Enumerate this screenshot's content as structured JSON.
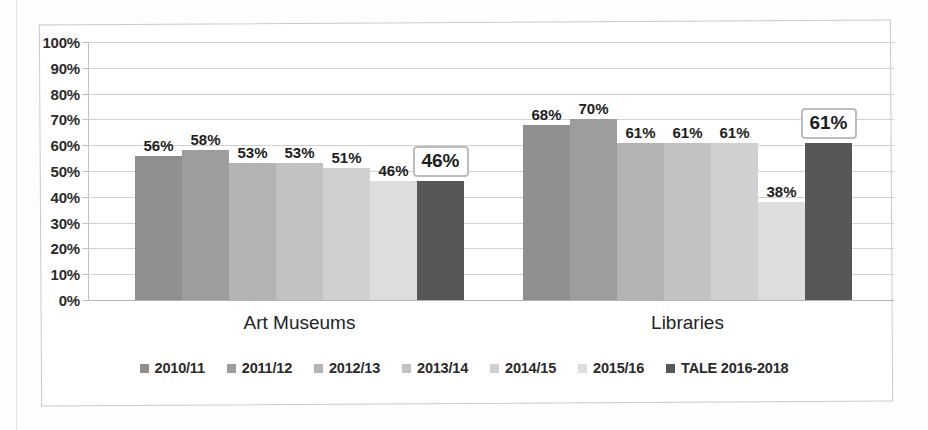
{
  "chart_data": {
    "type": "bar",
    "title": "",
    "subtitle": "",
    "xlabel": "",
    "ylabel": "",
    "ylim": [
      0,
      100
    ],
    "ytick_labels": [
      "100%",
      "90%",
      "80%",
      "70%",
      "60%",
      "50%",
      "40%",
      "30%",
      "20%",
      "10%",
      "0%"
    ],
    "ytick_values": [
      100,
      90,
      80,
      70,
      60,
      50,
      40,
      30,
      20,
      10,
      0
    ],
    "grid": true,
    "legend_position": "bottom",
    "categories": [
      "Art Museums",
      "Libraries"
    ],
    "series": [
      {
        "name": "2010/11",
        "color": "#8f8f8f",
        "values": [
          56,
          68
        ],
        "labels": [
          "56%",
          "68%"
        ]
      },
      {
        "name": "2011/12",
        "color": "#9d9d9d",
        "values": [
          58,
          70
        ],
        "labels": [
          "58%",
          "70%"
        ]
      },
      {
        "name": "2012/13",
        "color": "#b3b3b3",
        "values": [
          53,
          61
        ],
        "labels": [
          "53%",
          "61%"
        ]
      },
      {
        "name": "2013/14",
        "color": "#c2c2c2",
        "values": [
          53,
          61
        ],
        "labels": [
          "53%",
          "61%"
        ]
      },
      {
        "name": "2014/15",
        "color": "#d0d0d0",
        "values": [
          51,
          61
        ],
        "labels": [
          "51%",
          "61%"
        ]
      },
      {
        "name": "2015/16",
        "color": "#dddddd",
        "values": [
          46,
          38
        ],
        "labels": [
          "46%",
          "38%"
        ]
      },
      {
        "name": "TALE 2016-2018",
        "color": "#575757",
        "values": [
          46,
          61
        ],
        "labels": [
          "46%",
          "61%"
        ],
        "highlighted": true
      }
    ]
  },
  "legend": {
    "items": [
      {
        "label": "2010/11",
        "color": "#8f8f8f"
      },
      {
        "label": "2011/12",
        "color": "#9d9d9d"
      },
      {
        "label": "2012/13",
        "color": "#b3b3b3"
      },
      {
        "label": "2013/14",
        "color": "#c2c2c2"
      },
      {
        "label": "2014/15",
        "color": "#d0d0d0"
      },
      {
        "label": "2015/16",
        "color": "#dddddd"
      },
      {
        "label": "TALE 2016-2018",
        "color": "#575757"
      }
    ]
  },
  "axis": {
    "y_labels": [
      "100%",
      "90%",
      "80%",
      "70%",
      "60%",
      "50%",
      "40%",
      "30%",
      "20%",
      "10%",
      "0%"
    ]
  },
  "groups": [
    {
      "label": "Art Museums"
    },
    {
      "label": "Libraries"
    }
  ]
}
